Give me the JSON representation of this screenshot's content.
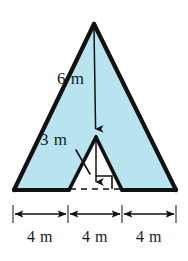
{
  "figure": {
    "colors": {
      "fill": "#b8e4f0",
      "outline": "#111111",
      "text": "#1a1a1a",
      "background": "#ffffff"
    },
    "labels": {
      "height": "6 m",
      "slant": "3 m",
      "segments": [
        "4 m",
        "4 m",
        "4 m"
      ]
    },
    "icons": {
      "height_arrow": "down-arrow-icon",
      "slant_leader": "leader-line-icon",
      "right_angle": "right-angle-marker-icon",
      "dashed_base": "dashed-line-icon",
      "dimension_arrow": "double-headed-arrow-icon",
      "tick": "tick-mark-icon"
    },
    "geometry": {
      "apex": [
        94,
        24
      ],
      "base_left": [
        14,
        190
      ],
      "base_right": [
        176,
        190
      ],
      "notch_apex": [
        96,
        137
      ],
      "notch_left": [
        69,
        190
      ],
      "notch_right": [
        122,
        190
      ],
      "right_angle_corner": [
        96,
        190
      ],
      "dimension_ticks": [
        13,
        68,
        122,
        176
      ],
      "dimension_line_y": 214
    }
  }
}
